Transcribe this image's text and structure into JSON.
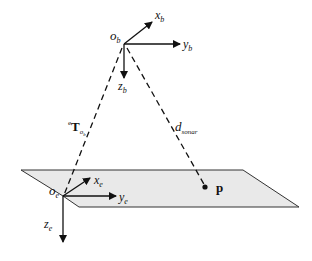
{
  "diagram": {
    "colors": {
      "line": "#111111",
      "plane_fill": "#e9e9e9",
      "plane_stroke": "#333333"
    },
    "frames": {
      "body": {
        "origin": "o",
        "origin_sub": "b",
        "axes": [
          {
            "name": "x",
            "sub": "b"
          },
          {
            "name": "y",
            "sub": "b"
          },
          {
            "name": "z",
            "sub": "b"
          }
        ]
      },
      "earth": {
        "origin": "o",
        "origin_sub": "e",
        "axes": [
          {
            "name": "x",
            "sub": "e"
          },
          {
            "name": "y",
            "sub": "e"
          },
          {
            "name": "z",
            "sub": "e"
          }
        ]
      }
    },
    "transform_label": {
      "pre_sup": "e",
      "symbol": "T",
      "sub": "o",
      "subsub": "b"
    },
    "distance_label": {
      "symbol": "d",
      "sub": "sonar"
    },
    "point_label": "p"
  }
}
